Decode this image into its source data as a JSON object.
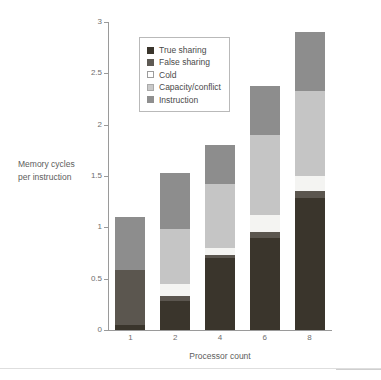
{
  "chart_data": {
    "type": "bar",
    "stacked": true,
    "title": "",
    "xlabel": "Processor count",
    "ylabel": "Memory cycles per instruction",
    "categories": [
      "1",
      "2",
      "4",
      "6",
      "8"
    ],
    "ylim": [
      0,
      3
    ],
    "yticks": [
      0,
      0.5,
      1,
      1.5,
      2,
      2.5,
      3
    ],
    "ytick_labels": [
      "0",
      "0.5",
      "1",
      "1.5",
      "2",
      "2.5",
      "3"
    ],
    "grid": false,
    "legend_position": "upper-left-inside",
    "series": [
      {
        "name": "True sharing",
        "color": "#3a352c",
        "values": [
          0.05,
          0.28,
          0.7,
          0.9,
          1.29
        ]
      },
      {
        "name": "False sharing",
        "color": "#5b564f",
        "values": [
          0.53,
          0.05,
          0.03,
          0.05,
          0.06
        ]
      },
      {
        "name": "Cold",
        "color": "#f4f4f2",
        "values": [
          0.0,
          0.12,
          0.07,
          0.17,
          0.15
        ]
      },
      {
        "name": "Capacity/conflict",
        "color": "#c5c5c5",
        "values": [
          0.0,
          0.53,
          0.62,
          0.78,
          0.83
        ]
      },
      {
        "name": "Instruction",
        "color": "#8d8d8d",
        "values": [
          0.52,
          0.55,
          0.38,
          0.48,
          0.57
        ]
      }
    ],
    "totals": [
      1.1,
      1.53,
      1.8,
      2.38,
      2.9
    ]
  },
  "axis": {
    "y_title_line1": "Memory cycles",
    "y_title_line2": "per instruction",
    "x_title": "Processor count"
  },
  "legend": {
    "items": [
      {
        "label": "True sharing",
        "color": "#3a352c",
        "border": "#3a352c"
      },
      {
        "label": "False sharing",
        "color": "#5e5a54",
        "border": "#5e5a54"
      },
      {
        "label": "Cold",
        "color": "#ffffff",
        "border": "#9c9c9c"
      },
      {
        "label": "Capacity/conflict",
        "color": "#c9c9c9",
        "border": "#a9a9a9"
      },
      {
        "label": "Instruction",
        "color": "#8f8f8f",
        "border": "#8f8f8f"
      }
    ]
  },
  "colors": {
    "axis": "#9a9a9a",
    "tick_text": "#6e6e6e",
    "title_text": "#5d5d5d",
    "legend_border": "#b9b9b9",
    "background": "#ffffff"
  }
}
